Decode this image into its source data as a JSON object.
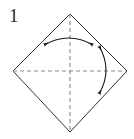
{
  "figure": {
    "kind": "origami-step-diagram",
    "step_label": "1",
    "caption": "",
    "canvas": {
      "width": 134,
      "height": 139,
      "background": "#ffffff"
    },
    "colors": {
      "outline": "#333333",
      "fold_line": "#888888",
      "arrow": "#1a1a1a",
      "label": "#2a2a2a",
      "background": "#ffffff"
    },
    "shape": {
      "name": "square-rotated-45",
      "description": "diamond",
      "vertices": [
        {
          "name": "top",
          "x": 70,
          "y": 14
        },
        {
          "name": "right",
          "x": 127,
          "y": 71
        },
        {
          "name": "bottom",
          "x": 70,
          "y": 132
        },
        {
          "name": "left",
          "x": 13,
          "y": 71
        }
      ],
      "stroke_width": 1
    },
    "fold_lines": [
      {
        "name": "vertical-fold-line",
        "style": "dashed",
        "from": {
          "x": 70,
          "y": 14
        },
        "to": {
          "x": 70,
          "y": 132
        },
        "dash": "4 3"
      },
      {
        "name": "horizontal-fold-line",
        "style": "dashed",
        "from": {
          "x": 13,
          "y": 71
        },
        "to": {
          "x": 127,
          "y": 71
        },
        "dash": "4 3"
      }
    ],
    "arrows": [
      {
        "name": "horizontal-fold-arrow",
        "type": "double-headed-curved",
        "orientation": "horizontal",
        "bow": "up",
        "start": {
          "x": 44,
          "y": 45
        },
        "end": {
          "x": 93,
          "y": 45
        },
        "control": {
          "x": 69,
          "y": 31
        }
      },
      {
        "name": "vertical-fold-arrow",
        "type": "double-headed-curved",
        "orientation": "vertical",
        "bow": "right",
        "start": {
          "x": 99,
          "y": 46
        },
        "end": {
          "x": 99,
          "y": 94
        },
        "control": {
          "x": 113,
          "y": 70
        }
      }
    ]
  }
}
